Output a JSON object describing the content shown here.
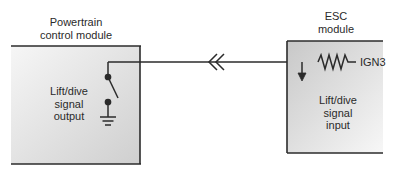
{
  "diagram": {
    "modules": [
      {
        "id": "pcm",
        "title_lines": [
          "Powertrain",
          "control module"
        ],
        "label_lines": [
          "Lift/dive",
          "signal",
          "output"
        ],
        "components": [
          "switch",
          "ground"
        ]
      },
      {
        "id": "esc",
        "title_lines": [
          "ESC",
          "module"
        ],
        "label_lines": [
          "Lift/dive",
          "signal",
          "input"
        ],
        "components": [
          "pull-up-resistor",
          "input-arrow"
        ]
      }
    ],
    "supply_label": "IGN3",
    "connector": "inline-connector",
    "colors": {
      "line": "#2b2b2b",
      "box_fill_dark": "#c9c9c9",
      "box_fill_light": "#f4f4f4",
      "text": "#2a2a2a"
    }
  }
}
